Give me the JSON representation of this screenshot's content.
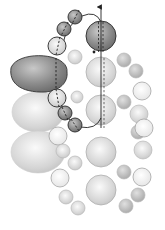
{
  "diagram": {
    "colors": {
      "background": "#ffffff",
      "dark_sphere": "#8a8a8a",
      "mid_sphere": "#b4b4b4",
      "light_sphere": "#d8d8d8",
      "pale_sphere": "#eeeeee",
      "outline": "#333333",
      "axis": "#222222"
    },
    "axis_arrow": {
      "x": 101,
      "y_top": 3,
      "y_bottom": 128
    },
    "chain_curve": {
      "upper": "M62,48 Q66,24 82,16 Q96,10 101,22",
      "lower": "M60,100 Q64,120 80,127 Q96,130 101,118"
    },
    "highlighted_spheres": [
      {
        "name": "top-axis-sphere",
        "cx": 101,
        "cy": 36,
        "r": 15,
        "shade": "dark"
      },
      {
        "name": "chain-upper-1",
        "cx": 75,
        "cy": 17,
        "r": 7,
        "shade": "dark"
      },
      {
        "name": "chain-upper-2",
        "cx": 64,
        "cy": 29,
        "r": 7,
        "shade": "dark"
      },
      {
        "name": "chain-upper-3",
        "cx": 57,
        "cy": 46,
        "r": 9,
        "shade": "light"
      },
      {
        "name": "chain-lower-1",
        "cx": 57,
        "cy": 98,
        "r": 9,
        "shade": "light"
      },
      {
        "name": "chain-lower-2",
        "cx": 65,
        "cy": 113,
        "r": 7,
        "shade": "dark"
      },
      {
        "name": "chain-lower-3",
        "cx": 75,
        "cy": 125,
        "r": 7,
        "shade": "dark"
      }
    ],
    "large_lobe": {
      "cx": 40,
      "cy": 72,
      "rx": 29,
      "ry": 20,
      "shade": "dark"
    },
    "background_lobes": [
      {
        "cx": 38,
        "cy": 112,
        "rx": 26,
        "ry": 20
      },
      {
        "cx": 38,
        "cy": 152,
        "rx": 27,
        "ry": 21
      }
    ],
    "axis_column_spheres": [
      {
        "cx": 101,
        "cy": 72,
        "r": 15
      },
      {
        "cx": 101,
        "cy": 110,
        "r": 15
      },
      {
        "cx": 101,
        "cy": 152,
        "r": 15
      },
      {
        "cx": 101,
        "cy": 190,
        "r": 15
      }
    ],
    "small_spheres": [
      {
        "cx": 75,
        "cy": 57,
        "r": 7,
        "shade": "light"
      },
      {
        "cx": 77,
        "cy": 97,
        "r": 6,
        "shade": "light"
      },
      {
        "cx": 58,
        "cy": 136,
        "r": 9,
        "shade": "pale"
      },
      {
        "cx": 63,
        "cy": 151,
        "r": 7,
        "shade": "light"
      },
      {
        "cx": 75,
        "cy": 163,
        "r": 7,
        "shade": "light"
      },
      {
        "cx": 60,
        "cy": 178,
        "r": 9,
        "shade": "pale"
      },
      {
        "cx": 66,
        "cy": 197,
        "r": 7,
        "shade": "light"
      },
      {
        "cx": 78,
        "cy": 208,
        "r": 7,
        "shade": "light"
      },
      {
        "cx": 124,
        "cy": 60,
        "r": 7,
        "shade": "mid"
      },
      {
        "cx": 136,
        "cy": 71,
        "r": 7,
        "shade": "mid"
      },
      {
        "cx": 142,
        "cy": 91,
        "r": 9,
        "shade": "pale"
      },
      {
        "cx": 124,
        "cy": 102,
        "r": 7,
        "shade": "mid"
      },
      {
        "cx": 139,
        "cy": 114,
        "r": 9,
        "shade": "light"
      },
      {
        "cx": 138,
        "cy": 132,
        "r": 7,
        "shade": "mid"
      },
      {
        "cx": 144,
        "cy": 128,
        "r": 9,
        "shade": "pale"
      },
      {
        "cx": 143,
        "cy": 150,
        "r": 9,
        "shade": "light"
      },
      {
        "cx": 124,
        "cy": 172,
        "r": 7,
        "shade": "mid"
      },
      {
        "cx": 142,
        "cy": 177,
        "r": 9,
        "shade": "pale"
      },
      {
        "cx": 138,
        "cy": 195,
        "r": 7,
        "shade": "mid"
      },
      {
        "cx": 126,
        "cy": 206,
        "r": 7,
        "shade": "mid"
      }
    ]
  }
}
